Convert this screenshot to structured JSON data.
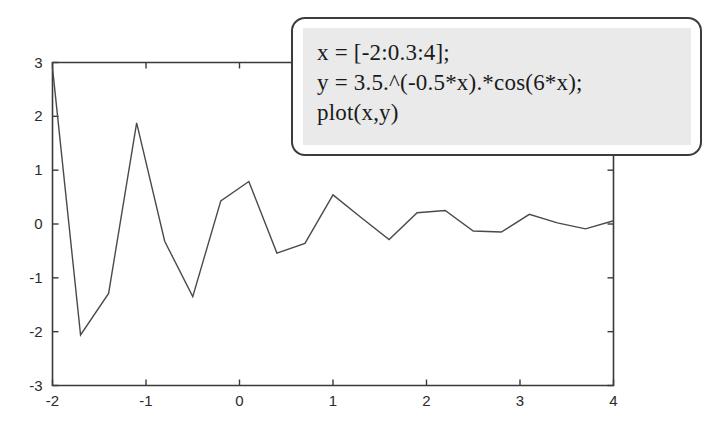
{
  "figure": {
    "background_color": "#ffffff",
    "line_color": "#4a4a4a",
    "axis_color": "#3a3a3a"
  },
  "callout": {
    "name": "code-callout",
    "border_color": "#3c3c3c",
    "fill_color": "#eaeaea",
    "lines": [
      "x = [-2:0.3:4];",
      "y = 3.5.^(-0.5*x).*cos(6*x);",
      "plot(x,y)"
    ],
    "line1": "x = [-2:0.3:4];",
    "line2": "y = 3.5.^(-0.5*x).*cos(6*x);",
    "line3": "plot(x,y)"
  },
  "chart_data": {
    "type": "line",
    "title": "",
    "xlabel": "",
    "ylabel": "",
    "xlim": [
      -2,
      4
    ],
    "ylim": [
      -3,
      3
    ],
    "xticks": [
      -2,
      -1,
      0,
      1,
      2,
      3,
      4
    ],
    "xtick_labels": [
      "-2",
      "-1",
      "0",
      "1",
      "2",
      "3",
      "4"
    ],
    "yticks": [
      -3,
      -2,
      -1,
      0,
      1,
      2,
      3
    ],
    "ytick_labels": [
      "-3",
      "-2",
      "-1",
      "0",
      "1",
      "2",
      "3"
    ],
    "grid": false,
    "legend": null,
    "expression": "y = 3.5.^(-0.5*x).*cos(6*x)",
    "x": [
      -2,
      -1.7,
      -1.4,
      -1.1,
      -0.8,
      -0.5,
      -0.2,
      0.1,
      0.4,
      0.7,
      1.0,
      1.3,
      1.6,
      1.9,
      2.2,
      2.5,
      2.8,
      3.1,
      3.4,
      3.7,
      4.0
    ],
    "values": [
      2.9,
      -2.06,
      -1.29,
      1.88,
      -0.32,
      -1.35,
      0.43,
      0.79,
      -0.54,
      -0.36,
      0.54,
      0.12,
      -0.29,
      0.21,
      0.25,
      -0.13,
      -0.15,
      0.18,
      0.02,
      -0.09,
      0.06
    ],
    "series": [
      {
        "name": "y",
        "values": [
          2.9,
          -2.06,
          -1.29,
          1.88,
          -0.32,
          -1.35,
          0.43,
          0.79,
          -0.54,
          -0.36,
          0.54,
          0.12,
          -0.29,
          0.21,
          0.25,
          -0.13,
          -0.15,
          0.18,
          0.02,
          -0.09,
          0.06
        ]
      }
    ]
  }
}
